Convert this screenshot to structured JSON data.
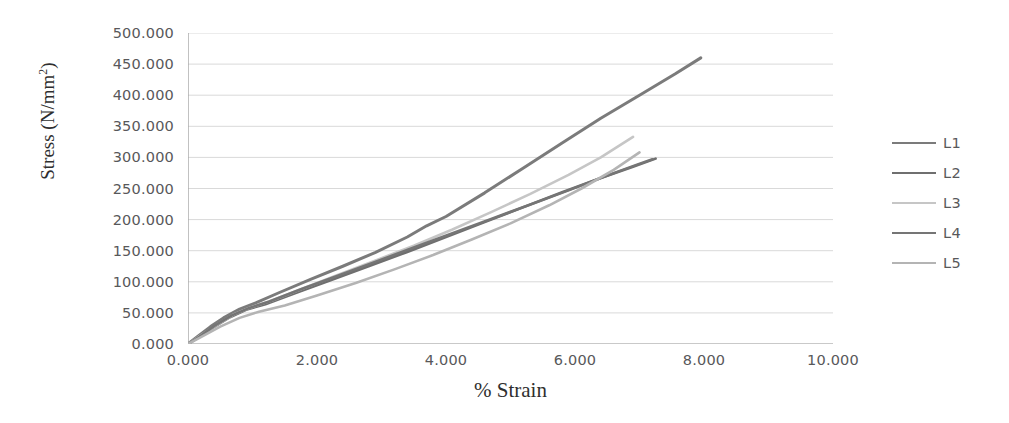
{
  "chart_data": {
    "type": "line",
    "title": "",
    "xlabel": "% Strain",
    "ylabel": "Stress (N/mm²)",
    "xlim": [
      0,
      10
    ],
    "ylim": [
      0,
      500
    ],
    "xticks": [
      "0.000",
      "2.000",
      "4.000",
      "6.000",
      "8.000",
      "10.000"
    ],
    "xtick_values": [
      0,
      2,
      4,
      6,
      8,
      10
    ],
    "yticks": [
      "0.000",
      "50.000",
      "100.000",
      "150.000",
      "200.000",
      "250.000",
      "300.000",
      "350.000",
      "400.000",
      "450.000",
      "500.000"
    ],
    "ytick_values": [
      0,
      50,
      100,
      150,
      200,
      250,
      300,
      350,
      400,
      450,
      500
    ],
    "grid": "horizontal",
    "legend_position": "right",
    "series": [
      {
        "name": "L1",
        "color": "#7b7b7b",
        "width": 3.0,
        "points": [
          [
            0.0,
            0
          ],
          [
            0.15,
            12
          ],
          [
            0.35,
            28
          ],
          [
            0.55,
            42
          ],
          [
            0.8,
            56
          ],
          [
            1.05,
            66
          ],
          [
            1.4,
            82
          ],
          [
            1.9,
            104
          ],
          [
            2.4,
            125
          ],
          [
            2.9,
            147
          ],
          [
            3.4,
            172
          ],
          [
            3.7,
            190
          ],
          [
            4.0,
            205
          ],
          [
            4.6,
            243
          ],
          [
            5.2,
            283
          ],
          [
            5.8,
            323
          ],
          [
            6.4,
            363
          ],
          [
            7.0,
            400
          ],
          [
            7.55,
            434
          ],
          [
            7.95,
            460
          ]
        ]
      },
      {
        "name": "L2",
        "color": "#6f6f6f",
        "width": 2.6,
        "points": [
          [
            0.0,
            0
          ],
          [
            0.15,
            10
          ],
          [
            0.4,
            27
          ],
          [
            0.65,
            43
          ],
          [
            0.9,
            55
          ],
          [
            1.2,
            64
          ],
          [
            1.7,
            83
          ],
          [
            2.2,
            102
          ],
          [
            2.8,
            125
          ],
          [
            3.4,
            148
          ],
          [
            4.0,
            172
          ],
          [
            4.6,
            196
          ],
          [
            5.2,
            220
          ],
          [
            5.8,
            244
          ],
          [
            6.4,
            267
          ],
          [
            6.9,
            285
          ],
          [
            7.25,
            298
          ]
        ]
      },
      {
        "name": "L3",
        "color": "#c6c6c6",
        "width": 2.6,
        "points": [
          [
            0.0,
            0
          ],
          [
            0.2,
            14
          ],
          [
            0.45,
            31
          ],
          [
            0.7,
            47
          ],
          [
            0.95,
            58
          ],
          [
            1.3,
            70
          ],
          [
            1.8,
            90
          ],
          [
            2.3,
            110
          ],
          [
            2.9,
            134
          ],
          [
            3.5,
            158
          ],
          [
            4.1,
            184
          ],
          [
            4.7,
            212
          ],
          [
            5.3,
            241
          ],
          [
            5.9,
            272
          ],
          [
            6.4,
            300
          ],
          [
            6.9,
            333
          ]
        ]
      },
      {
        "name": "L4",
        "color": "#757575",
        "width": 2.6,
        "points": [
          [
            0.0,
            0
          ],
          [
            0.18,
            12
          ],
          [
            0.42,
            30
          ],
          [
            0.68,
            46
          ],
          [
            0.95,
            58
          ],
          [
            1.25,
            68
          ],
          [
            1.75,
            88
          ],
          [
            2.3,
            109
          ],
          [
            2.9,
            132
          ],
          [
            3.5,
            155
          ],
          [
            4.1,
            178
          ],
          [
            4.7,
            201
          ],
          [
            5.3,
            224
          ],
          [
            5.9,
            247
          ],
          [
            6.45,
            269
          ],
          [
            6.95,
            288
          ],
          [
            7.2,
            297
          ]
        ]
      },
      {
        "name": "L5",
        "color": "#b4b4b4",
        "width": 2.6,
        "points": [
          [
            0.0,
            0
          ],
          [
            0.2,
            11
          ],
          [
            0.5,
            28
          ],
          [
            0.8,
            42
          ],
          [
            1.1,
            52
          ],
          [
            1.5,
            62
          ],
          [
            2.0,
            78
          ],
          [
            2.6,
            98
          ],
          [
            3.2,
            120
          ],
          [
            3.8,
            143
          ],
          [
            4.4,
            168
          ],
          [
            5.0,
            194
          ],
          [
            5.6,
            223
          ],
          [
            6.1,
            250
          ],
          [
            6.6,
            280
          ],
          [
            7.0,
            308
          ]
        ]
      }
    ]
  },
  "legend": {
    "items": [
      {
        "label": "L1"
      },
      {
        "label": "L2"
      },
      {
        "label": "L3"
      },
      {
        "label": "L4"
      },
      {
        "label": "L5"
      }
    ]
  },
  "colors": {
    "grid": "#d9d9d9",
    "axis": "#a6a6a6",
    "text": "#58585a",
    "title_text": "#2f2f2f",
    "background": "#ffffff"
  }
}
